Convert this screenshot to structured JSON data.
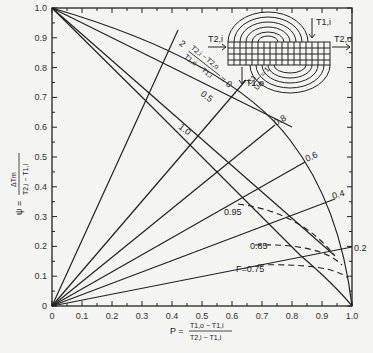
{
  "chart_data": {
    "type": "line",
    "title": "",
    "xlabel": "P = (T1,o - T1,i) / (T2,i - T1,i)",
    "ylabel": "ψ = ΔTm / (T2,i - T1,i)",
    "xlim": [
      0,
      1.0
    ],
    "ylim": [
      0,
      1.0
    ],
    "x_ticks": [
      "0",
      "0.1",
      "0.2",
      "0.3",
      "0.4",
      "0.5",
      "0.6",
      "0.7",
      "0.8",
      "0.9",
      "1.0"
    ],
    "y_ticks": [
      "0",
      "0.1",
      "0.2",
      "0.3",
      "0.4",
      "0.5",
      "0.6",
      "0.7",
      "0.8",
      "0.9",
      "1.0"
    ],
    "grid": false,
    "annotations": {
      "R_label_expr": "(T2,i - T2,o)/(T1,o - T1,i) = 0",
      "R_values": [
        "2",
        "0.5",
        "1.0"
      ],
      "NTU_label": "C1/UA = 1",
      "NTU_values": [
        "0.8",
        "0.6",
        "0.4",
        "0.2"
      ],
      "F_values": [
        "0.95",
        "0.85",
        "F=0.75"
      ],
      "diagram_labels": [
        "T2,i",
        "T2,o",
        "T1,i",
        "T1,o"
      ]
    },
    "series": [
      {
        "name": "R=0",
        "x": [
          0,
          0.8
        ],
        "y": [
          1.0,
          0.6
        ]
      },
      {
        "name": "R=0.5",
        "x": [
          0,
          0.94
        ],
        "y": [
          1.0,
          0.17
        ]
      },
      {
        "name": "R=1.0",
        "x": [
          0,
          0.3,
          0.6,
          0.85,
          1.0
        ],
        "y": [
          1.0,
          0.7,
          0.4,
          0.15,
          0.0
        ]
      },
      {
        "name": "envelope",
        "x": [
          0,
          0.5,
          0.75,
          0.9,
          0.97,
          1.0
        ],
        "y": [
          1.0,
          0.82,
          0.6,
          0.38,
          0.18,
          0.0
        ]
      },
      {
        "name": "R=2 (ray)",
        "x": [
          0,
          0.38
        ],
        "y": [
          0,
          0.96
        ]
      },
      {
        "name": "C1/UA=1 (ray)",
        "x": [
          0,
          0.66
        ],
        "y": [
          0,
          0.78
        ]
      },
      {
        "name": "0.8 (ray)",
        "x": [
          0,
          0.76
        ],
        "y": [
          0,
          0.64
        ]
      },
      {
        "name": "0.6 (ray)",
        "x": [
          0,
          0.86
        ],
        "y": [
          0,
          0.48
        ]
      },
      {
        "name": "0.4 (ray)",
        "x": [
          0,
          0.95
        ],
        "y": [
          0,
          0.33
        ]
      },
      {
        "name": "0.2 (ray)",
        "x": [
          0,
          1.0
        ],
        "y": [
          0,
          0.2
        ]
      },
      {
        "name": "F=0.95 (dashed)",
        "x": [
          0.62,
          0.75,
          0.88,
          0.93
        ],
        "y": [
          0.35,
          0.31,
          0.24,
          0.17
        ]
      },
      {
        "name": "F=0.85 (dashed)",
        "x": [
          0.67,
          0.8,
          0.9,
          0.96
        ],
        "y": [
          0.2,
          0.2,
          0.17,
          0.12
        ]
      },
      {
        "name": "F=0.75 (dashed)",
        "x": [
          0.69,
          0.82,
          0.92,
          0.98
        ],
        "y": [
          0.14,
          0.14,
          0.12,
          0.08
        ]
      }
    ]
  },
  "axes": {
    "x_label_lhs": "P =",
    "x_label_num": "T1,o − T1,i",
    "x_label_den": "T2,i − T1,i",
    "y_label_lhs": "ψ =",
    "y_label_num": "ΔTm",
    "y_label_den": "T2,i − T1,i"
  },
  "labels": {
    "r2": "2",
    "r05": "0.5",
    "r10": "1.0",
    "r_expr_num": "T2,i − T2,o",
    "r_expr_den": "T1,o − T1,i",
    "r_expr_eq": "= 0",
    "ntu_num": "C1",
    "ntu_den": "UA",
    "ntu_eq": "= 1",
    "n08": "0.8",
    "n06": "0.6",
    "n04": "0.4",
    "n02": "0.2",
    "f095": "0.95",
    "f085": "0.85",
    "f075": "F=0.75",
    "t2i": "T2,i",
    "t2o": "T2,o",
    "t1i": "T1,i",
    "t1o": "T1,o"
  }
}
